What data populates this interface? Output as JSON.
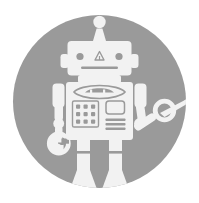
{
  "canvas": {
    "width": 199,
    "height": 203,
    "background_color": "#ffffff",
    "title": "Robot Avatar Icon"
  },
  "badge": {
    "shape": "circle",
    "fill_color": "#9a9a9a",
    "center_x": 99.5,
    "center_y": 101.5,
    "radius": 86.5
  },
  "robot": {
    "fill_color": "#f2f2f2",
    "detail_color": "#9a9a9a",
    "parts": {
      "antenna_ball": "antenna-ball",
      "antenna_stalk": "antenna-stalk",
      "head": "head",
      "left_ear": "left-ear",
      "right_ear": "right-ear",
      "eye_left": "eye-left",
      "eye_right": "eye-right",
      "nose": "nose-triangle",
      "mouth": "mouth-line",
      "neck": "neck",
      "torso": "torso",
      "chest_emblem": "chest-emblem",
      "keypad": "keypad-grid",
      "screen": "screen-panel",
      "status_bars": "status-bars",
      "left_shoulder": "left-shoulder",
      "left_upper_arm": "left-upper-arm",
      "left_elbow": "left-elbow",
      "left_forearm": "left-forearm",
      "left_hand": "left-hand-ring",
      "right_shoulder": "right-shoulder",
      "right_upper_arm": "right-upper-arm",
      "right_elbow": "right-elbow",
      "right_forearm": "right-forearm",
      "right_hand": "right-hand-ring",
      "tool": "pointer-tool",
      "left_leg": "left-leg",
      "right_leg": "right-leg",
      "left_knee": "left-knee",
      "right_knee": "right-knee",
      "left_foot": "left-foot",
      "right_foot": "right-foot"
    },
    "keypad_rows": 3,
    "keypad_cols": 3,
    "status_bar_count": 3
  }
}
